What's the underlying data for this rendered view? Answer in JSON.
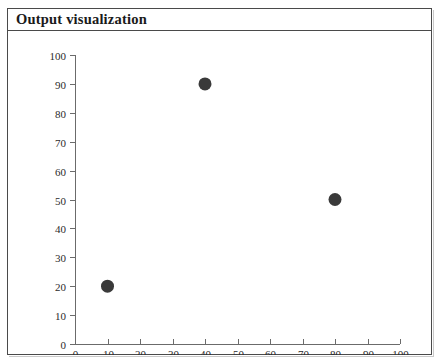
{
  "panel": {
    "title": "Output visualization",
    "border_color": "#4a4a4a",
    "background_color": "#ffffff"
  },
  "chart_data": {
    "type": "scatter",
    "title": "",
    "xlabel": "",
    "ylabel": "",
    "xlim": [
      0,
      100
    ],
    "ylim": [
      0,
      100
    ],
    "grid": false,
    "legend": false,
    "marker_color": "#3a3a3a",
    "marker_shape": "circle",
    "axis_color": "#6b6b6b",
    "x_ticks": [
      0,
      10,
      20,
      30,
      40,
      50,
      60,
      70,
      80,
      90,
      100
    ],
    "y_ticks": [
      0,
      10,
      20,
      30,
      40,
      50,
      60,
      70,
      80,
      90,
      100
    ],
    "x_tick_labels": [
      "0",
      "10",
      "20",
      "30",
      "40",
      "50",
      "60",
      "70",
      "80",
      "90",
      "100"
    ],
    "y_tick_labels": [
      "0",
      "10",
      "20",
      "30",
      "40",
      "50",
      "60",
      "70",
      "80",
      "90",
      "100"
    ],
    "points": [
      {
        "x": 10,
        "y": 20
      },
      {
        "x": 40,
        "y": 90
      },
      {
        "x": 80,
        "y": 50
      }
    ],
    "x": [
      10,
      40,
      80
    ],
    "values": [
      20,
      90,
      50
    ]
  }
}
